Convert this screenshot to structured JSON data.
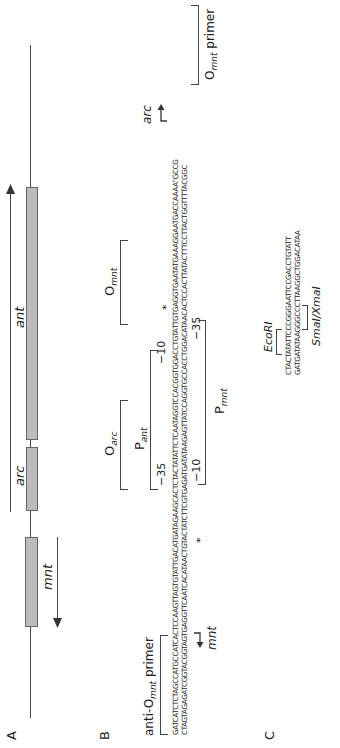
{
  "panels": {
    "a": "A",
    "b": "B",
    "c": "C"
  },
  "panelA": {
    "genes": [
      {
        "name": "mnt",
        "direction": "left"
      },
      {
        "name": "arc",
        "direction": "right"
      },
      {
        "name": "ant",
        "direction": "right"
      }
    ]
  },
  "panelB": {
    "top_strand": "GATCATCTCTAGCCATGCCATCACTCCAAGTTAGTGTATTGACATGATAGAAGCACTCTACTATATTCTCAATAGGTCCACGGTGGACCTGTATTGTGAGGTGAATATGAAAGGAATGACCAAAA\"GCCG",
    "bottom_strand": "CTAGTAGAGATCGGTACGGTAGTGAGGTTCAATCACATAACTGTACTATCTTCGTGAGATGATATAAGAGTTATCCAGGTGCCACCTGGACATAACACTCCACTTATACTTTCCTTACTGGTTTTACGGC",
    "labels": {
      "anti_primer_prefix": "anti-O",
      "anti_primer_sub": "mnt",
      "anti_primer_suffix": " primer",
      "o_arc": "O",
      "o_arc_sub": "arc",
      "p_ant": "P",
      "p_ant_sub": "ant",
      "o_mnt": "O",
      "o_mnt_sub": "mnt",
      "p_mnt": "P",
      "p_mnt_sub": "mnt",
      "minus35_top": "−35",
      "minus10_top": "−10",
      "minus10_bottom": "−10",
      "minus35_bottom": "−35",
      "star": "*",
      "mnt_arrow": "mnt",
      "arc_arrow": "arc",
      "primer_prefix": "O",
      "primer_sub": "mnt",
      "primer_suffix": " primer"
    }
  },
  "panelC": {
    "top_strand": "CTACTATATTCCCGGGAATTCCGACCTGTATT",
    "bottom_strand": "GATGATATAAGGGCCCTTAAGGCTGGACATAA",
    "ecori": "EcoRI",
    "smai": "SmaI/XmaI"
  }
}
